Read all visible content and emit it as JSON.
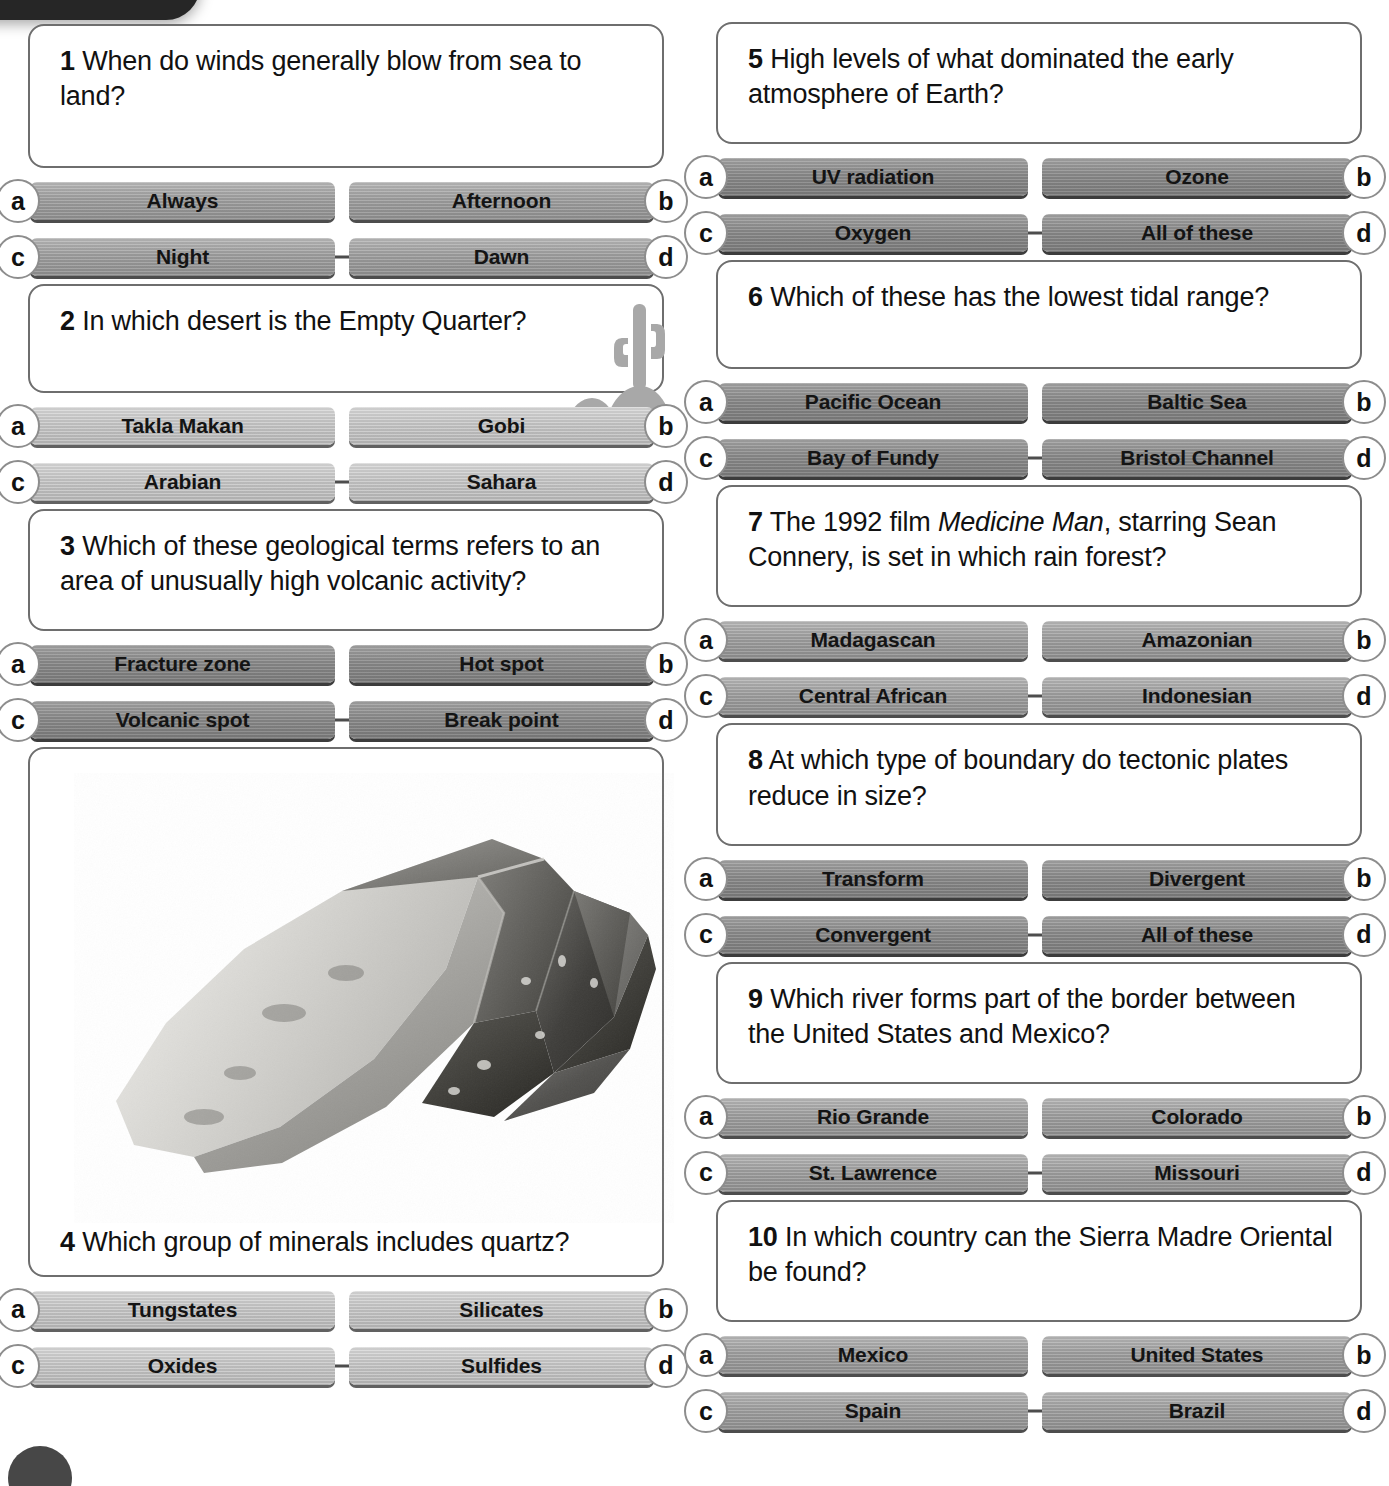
{
  "page": {
    "decor": {
      "top_tab": "dark-rounded-tab",
      "bottom_dot": "dark-circle"
    }
  },
  "quiz": {
    "left_column": [
      {
        "number": "1",
        "question_prefix": "When do winds generally blow from sea to land?",
        "tone": "normal",
        "body_space": "h1",
        "options": [
          {
            "letter": "a",
            "label": "Always"
          },
          {
            "letter": "b",
            "label": "Afternoon"
          },
          {
            "letter": "c",
            "label": "Night"
          },
          {
            "letter": "d",
            "label": "Dawn"
          }
        ]
      },
      {
        "number": "2",
        "question_prefix": "In which desert is the Empty Quarter?",
        "tone": "light",
        "body_space": "h1",
        "illustration": "desert-cactus-dune-icon",
        "options": [
          {
            "letter": "a",
            "label": "Takla Makan"
          },
          {
            "letter": "b",
            "label": "Gobi"
          },
          {
            "letter": "c",
            "label": "Arabian"
          },
          {
            "letter": "d",
            "label": "Sahara"
          }
        ]
      },
      {
        "number": "3",
        "question_prefix": "Which of these geological terms refers to an area of unusually high volcanic activity?",
        "tone": "dark",
        "body_space": "h2",
        "options": [
          {
            "letter": "a",
            "label": "Fracture zone"
          },
          {
            "letter": "b",
            "label": "Hot spot"
          },
          {
            "letter": "c",
            "label": "Volcanic spot"
          },
          {
            "letter": "d",
            "label": "Break point"
          }
        ]
      },
      {
        "number": "4",
        "question_prefix": "Which group of minerals includes quartz?",
        "tone": "light",
        "body_space": "h3",
        "illustration": "quartz-crystal-photo",
        "options": [
          {
            "letter": "a",
            "label": "Tungstates"
          },
          {
            "letter": "b",
            "label": "Silicates"
          },
          {
            "letter": "c",
            "label": "Oxides"
          },
          {
            "letter": "d",
            "label": "Sulfides"
          }
        ]
      }
    ],
    "right_column": [
      {
        "number": "5",
        "question_prefix": "High levels of what dominated the early atmosphere of Earth?",
        "tone": "dark",
        "body_space": "h2",
        "options": [
          {
            "letter": "a",
            "label": "UV radiation"
          },
          {
            "letter": "b",
            "label": "Ozone"
          },
          {
            "letter": "c",
            "label": "Oxygen"
          },
          {
            "letter": "d",
            "label": "All of these"
          }
        ]
      },
      {
        "number": "6",
        "question_prefix": "Which of these has the lowest tidal range?",
        "tone": "dark",
        "body_space": "h1",
        "options": [
          {
            "letter": "a",
            "label": "Pacific Ocean"
          },
          {
            "letter": "b",
            "label": "Baltic Sea"
          },
          {
            "letter": "c",
            "label": "Bay of Fundy"
          },
          {
            "letter": "d",
            "label": "Bristol Channel"
          }
        ]
      },
      {
        "number": "7",
        "question_prefix": "The 1992 film ",
        "question_italic": "Medicine Man",
        "question_suffix": ", starring Sean Connery, is set in which rain forest?",
        "tone": "normal",
        "body_space": "h2",
        "options": [
          {
            "letter": "a",
            "label": "Madagascan"
          },
          {
            "letter": "b",
            "label": "Amazonian"
          },
          {
            "letter": "c",
            "label": "Central African"
          },
          {
            "letter": "d",
            "label": "Indonesian"
          }
        ]
      },
      {
        "number": "8",
        "question_prefix": "At which type of boundary do tectonic plates reduce in size?",
        "tone": "dark",
        "body_space": "h2",
        "options": [
          {
            "letter": "a",
            "label": "Transform"
          },
          {
            "letter": "b",
            "label": "Divergent"
          },
          {
            "letter": "c",
            "label": "Convergent"
          },
          {
            "letter": "d",
            "label": "All of these"
          }
        ]
      },
      {
        "number": "9",
        "question_prefix": "Which river forms part of the border between the United States and Mexico?",
        "tone": "normal",
        "body_space": "h2",
        "options": [
          {
            "letter": "a",
            "label": "Rio Grande"
          },
          {
            "letter": "b",
            "label": "Colorado"
          },
          {
            "letter": "c",
            "label": "St. Lawrence"
          },
          {
            "letter": "d",
            "label": "Missouri"
          }
        ]
      },
      {
        "number": "10",
        "question_prefix": "In which country can the Sierra Madre Oriental be found?",
        "tone": "normal",
        "body_space": "h2",
        "options": [
          {
            "letter": "a",
            "label": "Mexico"
          },
          {
            "letter": "b",
            "label": "United States"
          },
          {
            "letter": "c",
            "label": "Spain"
          },
          {
            "letter": "d",
            "label": "Brazil"
          }
        ]
      }
    ]
  },
  "colors": {
    "card_border": "#6e6e6e",
    "button_normal": "#9e9e9e",
    "button_dark": "#8a8a8a",
    "button_light": "#c2c2c2",
    "text": "#111111",
    "decor_dark": "#262626"
  }
}
